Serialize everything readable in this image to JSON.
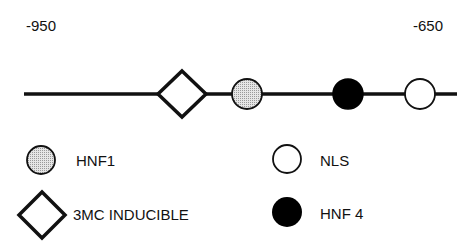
{
  "axis": {
    "left_label": "-950",
    "right_label": "-650"
  },
  "elements": [
    {
      "type": "3mc-inducible",
      "shape": "diamond"
    },
    {
      "type": "hnf1",
      "shape": "circle-gray"
    },
    {
      "type": "hnf4",
      "shape": "circle-black"
    },
    {
      "type": "nls",
      "shape": "circle-white"
    }
  ],
  "legend": {
    "hnf1": "HNF1",
    "nls": "NLS",
    "inducible": "3MC INDUCIBLE",
    "hnf4": "HNF 4"
  },
  "colors": {
    "hnf1_fill": "#c8c8c8",
    "hnf4_fill": "#000000",
    "nls_fill": "#ffffff",
    "line": "#111111"
  }
}
